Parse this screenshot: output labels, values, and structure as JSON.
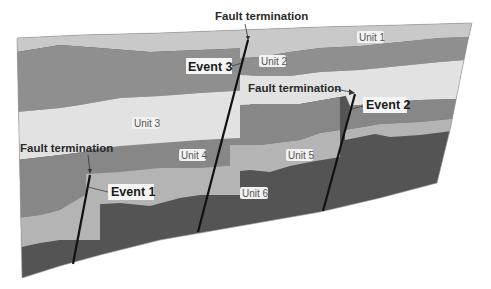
{
  "diagram": {
    "type": "geologic cross-section",
    "units": [
      {
        "id": "unit1",
        "label": "Unit 1",
        "color": "#c9c9c9"
      },
      {
        "id": "unit2",
        "label": "Unit 2",
        "color": "#8f8f8f"
      },
      {
        "id": "unit3",
        "label": "Unit 3",
        "color": "#e2e2e2"
      },
      {
        "id": "unit4",
        "label": "Unit 4",
        "color": "#878787"
      },
      {
        "id": "unit5",
        "label": "Unit 5",
        "color": "#b4b4b4"
      },
      {
        "id": "unit6",
        "label": "Unit 6",
        "color": "#545454"
      }
    ],
    "events": [
      {
        "label": "Event 1"
      },
      {
        "label": "Event 2"
      },
      {
        "label": "Event 3"
      }
    ],
    "fault_terminations": [
      {
        "label": "Fault termination",
        "fault": "Event 3"
      },
      {
        "label": "Fault termination",
        "fault": "Event 2"
      },
      {
        "label": "Fault termination",
        "fault": "Event 1"
      }
    ],
    "fault_line_color": "#111111"
  }
}
